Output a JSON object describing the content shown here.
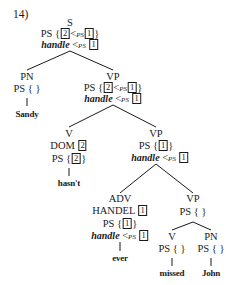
{
  "example_number": "14)",
  "tree": {
    "S": {
      "cat": "S",
      "ps_prefix": "PS {",
      "ps_box_a": "2",
      "ps_lt": "<",
      "ps_sub": "PS",
      "ps_box_b": "1",
      "ps_close": "}",
      "handle": "handle",
      "handle_lt": "<",
      "handle_sub": "PS",
      "handle_box": "1"
    },
    "PN1": {
      "cat": "PN",
      "ps": "PS { }",
      "word": "Sandy"
    },
    "VP1": {
      "cat": "VP",
      "ps_prefix": "PS {",
      "ps_box_a": "2",
      "ps_lt": "<",
      "ps_sub": "PS",
      "ps_box_b": "1",
      "ps_close": "}",
      "handle": "handle",
      "handle_lt": "<",
      "handle_sub": "PS",
      "handle_box": "1"
    },
    "V1": {
      "cat": "V",
      "dom": "DOM",
      "dom_box": "2",
      "ps_prefix": "PS {",
      "ps_box": "2",
      "ps_close": "}",
      "word": "hasn't"
    },
    "VP2": {
      "cat": "VP",
      "ps_prefix": "PS {",
      "ps_box": "1",
      "ps_close": "}",
      "handle": "handle",
      "handle_lt": "<",
      "handle_sub": "PS",
      "handle_box": "1"
    },
    "ADV": {
      "cat": "ADV",
      "handel": "HANDEL",
      "handel_box": "1",
      "ps_prefix": "PS {",
      "ps_box": "1",
      "ps_close": "}",
      "handle": "handle",
      "handle_lt": "<",
      "handle_sub": "PS",
      "handle_box": "1",
      "word": "ever"
    },
    "VP3": {
      "cat": "VP",
      "ps": "PS { }"
    },
    "V2": {
      "cat": "V",
      "ps": "PS { }",
      "word": "missed"
    },
    "PN2": {
      "cat": "PN",
      "ps": "PS { }",
      "word": "John"
    }
  }
}
